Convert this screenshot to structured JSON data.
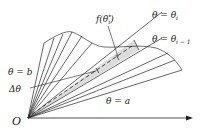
{
  "diagram": {
    "type": "polar-area-sector-decomposition",
    "labels": {
      "origin": "O",
      "theta_i": "θ = θ",
      "theta_i_sub": "i",
      "theta_i_minus_1": "θ = θ",
      "theta_i_minus_1_sub": "i − 1",
      "f_theta_star": "f(θ",
      "f_theta_star_sup": "*",
      "f_theta_star_sub": "i",
      "f_theta_star_close": ")",
      "theta_b": "θ = b",
      "delta_theta": "Δθ",
      "theta_a": "θ = a"
    },
    "colors": {
      "line": "#222222",
      "shaded_sector": "#dddddd",
      "background": "#ffffff"
    }
  }
}
